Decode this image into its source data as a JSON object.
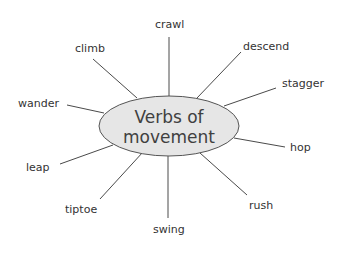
{
  "diagram": {
    "type": "mind-map",
    "center": {
      "label_line1": "Verbs of",
      "label_line2": "movement"
    },
    "branches": [
      {
        "id": "crawl",
        "label": "crawl"
      },
      {
        "id": "descend",
        "label": "descend"
      },
      {
        "id": "stagger",
        "label": "stagger"
      },
      {
        "id": "hop",
        "label": "hop"
      },
      {
        "id": "rush",
        "label": "rush"
      },
      {
        "id": "swing",
        "label": "swing"
      },
      {
        "id": "tiptoe",
        "label": "tiptoe"
      },
      {
        "id": "leap",
        "label": "leap"
      },
      {
        "id": "wander",
        "label": "wander"
      },
      {
        "id": "climb",
        "label": "climb"
      }
    ],
    "colors": {
      "hub_fill": "#e6e6e6",
      "hub_stroke": "#555555",
      "line": "#4a4a4a",
      "text": "#333333"
    }
  }
}
